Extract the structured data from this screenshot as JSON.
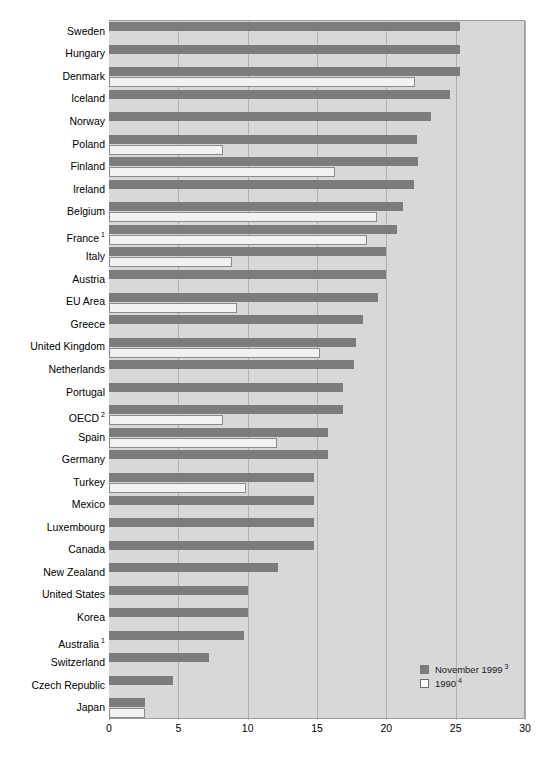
{
  "chart_data": {
    "type": "bar",
    "orientation": "horizontal",
    "title": "",
    "subtitle": "",
    "xlabel": "",
    "ylabel": "",
    "xlim": [
      0,
      30
    ],
    "xticks": [
      "0",
      "5",
      "10",
      "15",
      "20",
      "25",
      "30"
    ],
    "grid": "vertical",
    "legend_position": "bottom-right",
    "categories": [
      "Sweden",
      "Hungary",
      "Denmark",
      "Iceland",
      "Norway",
      "Poland",
      "Finland",
      "Ireland",
      "Belgium",
      "France",
      "Italy",
      "Austria",
      "EU Area",
      "Greece",
      "United Kingdom",
      "Netherlands",
      "Portugal",
      "OECD",
      "Spain",
      "Germany",
      "Turkey",
      "Mexico",
      "Luxembourg",
      "Canada",
      "New Zealand",
      "United States",
      "Korea",
      "Australia",
      "Switzerland",
      "Czech Republic",
      "Japan"
    ],
    "category_footnotes": {
      "France": "1",
      "OECD": "2",
      "Australia": "1"
    },
    "series": [
      {
        "name": "November 1999",
        "footnote": "3",
        "color": "#7c7c7c",
        "values": [
          25.3,
          25.3,
          25.3,
          24.6,
          23.2,
          22.2,
          22.3,
          22.0,
          21.2,
          20.8,
          20.0,
          20.0,
          19.4,
          18.3,
          17.8,
          17.7,
          16.9,
          16.9,
          15.8,
          15.8,
          14.8,
          14.8,
          14.8,
          14.8,
          12.2,
          10.0,
          10.0,
          9.7,
          7.2,
          4.6,
          2.6
        ]
      },
      {
        "name": "1990",
        "footnote": "4",
        "color": "#f2f2f2",
        "values": [
          null,
          null,
          22.1,
          null,
          null,
          8.2,
          16.3,
          null,
          19.3,
          18.6,
          8.9,
          null,
          9.2,
          null,
          15.2,
          null,
          null,
          8.2,
          12.1,
          null,
          9.9,
          null,
          null,
          null,
          null,
          null,
          null,
          null,
          null,
          null,
          2.6
        ]
      }
    ]
  },
  "legend": {
    "entries": [
      {
        "label": "November 1999",
        "footnote": "3",
        "swatch": "dark"
      },
      {
        "label": "1990",
        "footnote": "4",
        "swatch": "light"
      }
    ]
  }
}
